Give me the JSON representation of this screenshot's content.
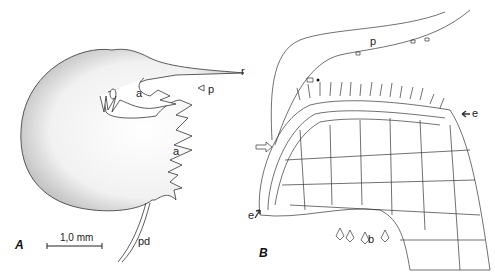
{
  "figure": {
    "background": "#ffffff",
    "line_color": "#333333",
    "panels": [
      {
        "id": "A",
        "label": "A",
        "description": "Trap (bladder) outer view, stippled",
        "labels": {
          "r": "r",
          "p": "p",
          "a_upper": "a",
          "a_lower": "a",
          "pd": "pd"
        },
        "scale_bar": {
          "text": "1,0 mm"
        }
      },
      {
        "id": "B",
        "label": "B",
        "description": "Section through trap entrance showing cell structure",
        "labels": {
          "p": "p",
          "e_right": "e",
          "e_left": "e",
          "b": "b",
          "asterisk": "*"
        }
      }
    ]
  }
}
